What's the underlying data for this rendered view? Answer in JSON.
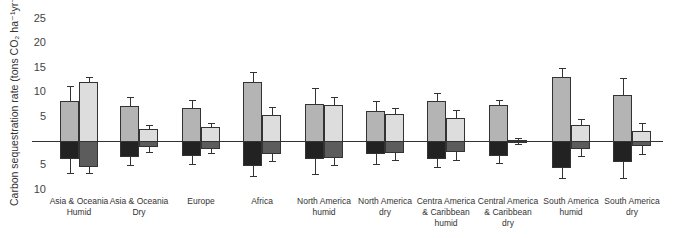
{
  "chart_data": {
    "type": "bar",
    "title": "",
    "ylabel": "Carbon sequestration rate (tons CO2 ha-1yr-1)",
    "ylabel_display": "Carbon sequestration rate (tons CO₂ ha⁻¹yr⁻¹)",
    "xlabel": "",
    "ylim": [
      -10,
      25
    ],
    "y_ticks": [
      {
        "value": 25,
        "label": "25"
      },
      {
        "value": 20,
        "label": "20"
      },
      {
        "value": 15,
        "label": "15"
      },
      {
        "value": 10,
        "label": "10"
      },
      {
        "value": 5,
        "label": "5"
      },
      {
        "value": -5,
        "label": "5"
      },
      {
        "value": -10,
        "label": "10"
      }
    ],
    "grid": false,
    "categories": [
      "Asia & Oceania Humid",
      "Asia & Oceania Dry",
      "Europe",
      "Africa",
      "North America humid",
      "North America dry",
      "Centra America & Caribbean humid",
      "Central America & Caribbean dry",
      "South America humid",
      "South America dry"
    ],
    "category_lines": [
      [
        "Asia & Oceania",
        "Humid"
      ],
      [
        "Asia & Oceania",
        "Dry"
      ],
      [
        "Europe"
      ],
      [
        "Africa"
      ],
      [
        "North America",
        "humid"
      ],
      [
        "North America",
        "dry"
      ],
      [
        "Centra America",
        "& Caribbean",
        "humid"
      ],
      [
        "Central America",
        "& Caribbean",
        "dry"
      ],
      [
        "South America",
        "humid"
      ],
      [
        "South America",
        "dry"
      ]
    ],
    "series": [
      {
        "name": "Series 1 (above axis, medium gray)",
        "color": "#b4b4b4",
        "values": [
          8.2,
          7.1,
          6.7,
          12.0,
          7.6,
          6.1,
          8.2,
          7.3,
          13.1,
          9.5
        ],
        "error_upper": [
          11.2,
          9.0,
          8.4,
          14.1,
          10.9,
          8.2,
          9.9,
          8.5,
          15.0,
          12.9
        ]
      },
      {
        "name": "Series 2 (above axis, light gray)",
        "color": "#dddddd",
        "values": [
          12.1,
          2.4,
          2.9,
          5.3,
          7.3,
          5.5,
          4.7,
          0.3,
          3.3,
          2.0
        ],
        "error_upper": [
          13.1,
          3.3,
          3.7,
          7.0,
          9.0,
          6.8,
          6.4,
          0.7,
          4.6,
          3.6
        ]
      },
      {
        "name": "Series 1 (below axis, black)",
        "color": "#222222",
        "values": [
          -3.7,
          -3.3,
          -3.1,
          -5.1,
          -3.6,
          -2.7,
          -3.6,
          -3.1,
          -5.6,
          -4.3
        ],
        "error_lower": [
          -6.6,
          -5.0,
          -4.8,
          -7.1,
          -6.8,
          -4.7,
          -5.3,
          -4.6,
          -7.5,
          -7.5
        ]
      },
      {
        "name": "Series 2 (below axis, dark gray)",
        "color": "#5c5c5c",
        "values": [
          -5.4,
          -1.3,
          -1.7,
          -2.6,
          -3.4,
          -2.5,
          -2.2,
          -0.3,
          -1.7,
          -1.0
        ],
        "error_lower": [
          -6.6,
          -2.2,
          -2.4,
          -4.2,
          -5.0,
          -3.9,
          -3.8,
          -0.7,
          -3.0,
          -2.6
        ]
      }
    ],
    "legend": "none"
  },
  "layout": {
    "baseline_y": 141,
    "px_per_unit": 4.88,
    "group_left_x": [
      60,
      120,
      182,
      243,
      305,
      366,
      427,
      489,
      552,
      613
    ],
    "bar_width": 19,
    "axis_x_start": 32,
    "axis_x_end": 663
  }
}
